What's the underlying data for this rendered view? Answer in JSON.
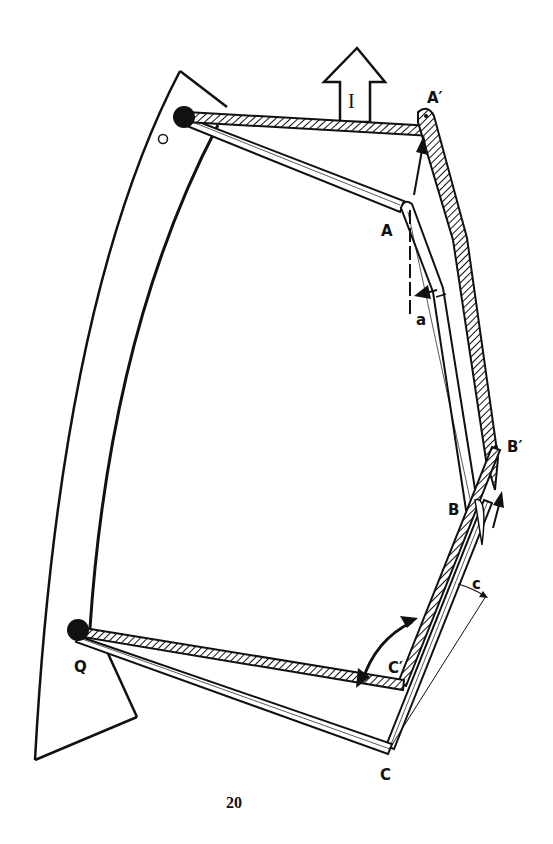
{
  "diagram": {
    "labels": {
      "O": "O",
      "Q": "Q",
      "A": "A",
      "A_prime": "A′",
      "B": "B",
      "B_prime": "B′",
      "C": "C",
      "C_prime": "C′",
      "a": "a",
      "c": "c",
      "direction": "I"
    },
    "page_number": "20",
    "colors": {
      "ink": "#111111",
      "paper": "#ffffff"
    }
  }
}
